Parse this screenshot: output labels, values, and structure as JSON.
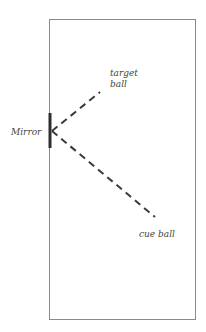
{
  "diagram": {
    "labels": {
      "mirror": "Mirror",
      "target_line1": "target",
      "target_line2": "ball",
      "cue": "cue ball"
    },
    "colors": {
      "frame": "#8a8a8a",
      "line": "#3a3a3a",
      "mirror": "#2e2e2e"
    }
  }
}
